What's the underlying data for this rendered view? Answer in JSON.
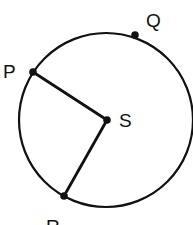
{
  "diagram": {
    "title": "",
    "colors": {
      "stroke": "#111111",
      "background": "#ffffff"
    },
    "circle": {
      "cx": 106,
      "cy": 120,
      "r": 87
    },
    "center": {
      "label": "S",
      "x": 107,
      "y": 120
    },
    "points": [
      {
        "label": "P",
        "x": 33,
        "y": 72
      },
      {
        "label": "Q",
        "x": 135,
        "y": 35
      },
      {
        "label": "R",
        "x": 64,
        "y": 196
      }
    ],
    "segments": [
      {
        "from": "P",
        "to": "S"
      },
      {
        "from": "S",
        "to": "R"
      }
    ],
    "labels": {
      "P": "P",
      "Q": "Q",
      "R": "R",
      "S": "S"
    }
  }
}
